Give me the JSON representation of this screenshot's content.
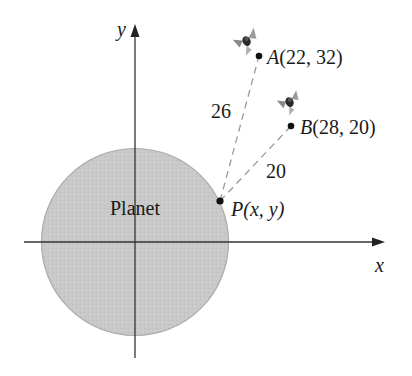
{
  "diagram": {
    "planet_label": "Planet",
    "axes": {
      "x_label": "x",
      "y_label": "y"
    },
    "points": {
      "A": {
        "name": "A",
        "coords": "(22, 32)",
        "x": 22,
        "y": 32
      },
      "B": {
        "name": "B",
        "coords": "(28, 20)",
        "x": 28,
        "y": 20
      },
      "P": {
        "name": "P",
        "coords": "(x, y)"
      }
    },
    "distances": {
      "PA": "26",
      "PB": "20"
    },
    "satellites": [
      "satellite-icon-A",
      "satellite-icon-B"
    ],
    "colors": {
      "planet_fill": "#c8c8c8",
      "planet_edge": "#a8a8a8",
      "axis": "#333333",
      "dashed_line": "#999999",
      "point": "#111111"
    }
  }
}
